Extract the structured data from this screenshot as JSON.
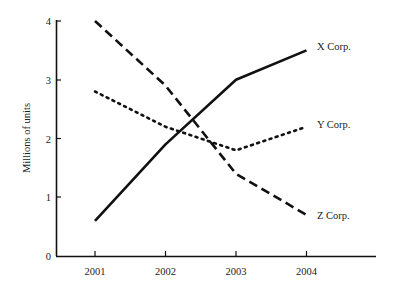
{
  "chart_data": {
    "type": "line",
    "title": "",
    "xlabel": "",
    "ylabel": "Millions of units",
    "categories": [
      "2001",
      "2002",
      "2003",
      "2004"
    ],
    "x": [
      2001,
      2002,
      2003,
      2004
    ],
    "ylim": [
      0,
      4
    ],
    "yticks": [
      "0",
      "1",
      "2",
      "3",
      "4"
    ],
    "grid": false,
    "legend_position": "inline-right",
    "series": [
      {
        "name": "X Corp.",
        "style": "solid",
        "values": [
          0.6,
          1.9,
          3.0,
          3.5
        ]
      },
      {
        "name": "Y Corp.",
        "style": "dotted",
        "values": [
          2.8,
          2.2,
          1.8,
          2.2
        ]
      },
      {
        "name": "Z Corp.",
        "style": "dashed",
        "values": [
          4.0,
          2.9,
          1.4,
          0.7
        ]
      }
    ]
  },
  "axis": {
    "y_title": "Millions of units",
    "y_ticks": [
      "0",
      "1",
      "2",
      "3",
      "4"
    ],
    "x_ticks": [
      "2001",
      "2002",
      "2003",
      "2004"
    ]
  },
  "legend": {
    "x": "X Corp.",
    "y": "Y Corp.",
    "z": "Z Corp."
  }
}
